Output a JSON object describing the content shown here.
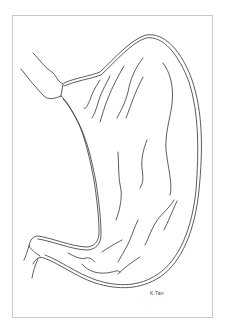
{
  "illustration": {
    "subject": "stomach line drawing",
    "signature": "K.Tan",
    "colors": {
      "background": "#ffffff",
      "frame": "#c8c8c8",
      "stroke": "#333333"
    }
  }
}
